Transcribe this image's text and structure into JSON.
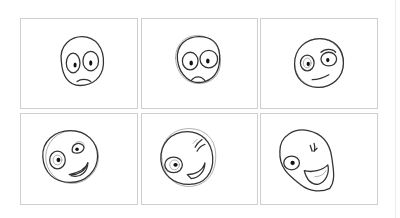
{
  "storyboard": {
    "layout": {
      "rows": 2,
      "columns": 3
    },
    "border_color": "#cfcfcf",
    "stroke_color": "#333333",
    "panels": [
      {
        "index": 1,
        "row": 1,
        "col": 1,
        "expression": "worried-wide-eyes",
        "mouth": "frown"
      },
      {
        "index": 2,
        "row": 1,
        "col": 2,
        "expression": "sad-frown",
        "mouth": "frown"
      },
      {
        "index": 3,
        "row": 1,
        "col": 3,
        "expression": "skeptical-smirk",
        "mouth": "smirk"
      },
      {
        "index": 4,
        "row": 2,
        "col": 1,
        "expression": "winking-grin",
        "mouth": "open-smile"
      },
      {
        "index": 5,
        "row": 2,
        "col": 2,
        "expression": "wink-laugh",
        "mouth": "open-smile"
      },
      {
        "index": 6,
        "row": 2,
        "col": 3,
        "expression": "wink-big-laugh",
        "mouth": "wide-open-smile"
      }
    ]
  }
}
